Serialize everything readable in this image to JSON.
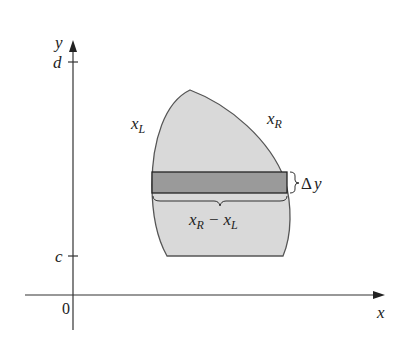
{
  "diagram": {
    "axes": {
      "x_label": "x",
      "y_label": "y",
      "origin_label": "0",
      "y_ticks": [
        {
          "label": "d",
          "y": 62
        },
        {
          "label": "c",
          "y": 256
        }
      ]
    },
    "curves": {
      "left_label_main": "x",
      "left_label_sub": "L",
      "right_label_main": "x",
      "right_label_sub": "R"
    },
    "strip": {
      "height_label_delta": "Δ",
      "height_label_var": "y",
      "width_label_a_main": "x",
      "width_label_a_sub": "R",
      "width_label_minus": "−",
      "width_label_b_main": "x",
      "width_label_b_sub": "L"
    },
    "colors": {
      "region_fill": "#d9d9d9",
      "strip_fill": "#9a9a9a",
      "outline": "#555555",
      "axis": "#333333"
    }
  }
}
